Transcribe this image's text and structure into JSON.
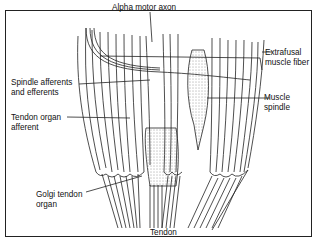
{
  "diagram": {
    "labels": {
      "alpha_motor_axon": "Alpha motor axon",
      "spindle_afferents_l1": "Spindle afferents",
      "spindle_afferents_l2": "and efferents",
      "tendon_organ_afferent_l1": "Tendon organ",
      "tendon_organ_afferent_l2": "afferent",
      "golgi_tendon_organ_l1": "Golgi tendon",
      "golgi_tendon_organ_l2": "organ",
      "extrafusal_l1": "Extrafusal",
      "extrafusal_l2": "muscle fiber",
      "muscle_spindle_l1": "Muscle",
      "muscle_spindle_l2": "spindle",
      "tendon": "Tendon"
    }
  }
}
